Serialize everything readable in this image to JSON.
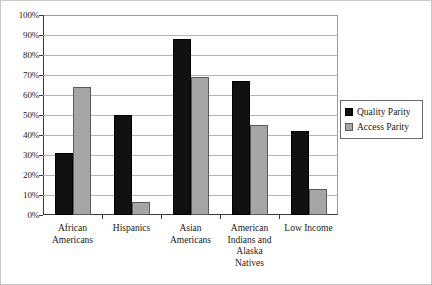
{
  "chart_data": {
    "type": "bar",
    "title": "",
    "xlabel": "",
    "ylabel": "",
    "ylim": [
      0,
      100
    ],
    "ytick_labels": [
      "100%",
      "90%",
      "80%",
      "70%",
      "60%",
      "50%",
      "40%",
      "30%",
      "20%",
      "10%",
      "0%"
    ],
    "ytick_values": [
      100,
      90,
      80,
      70,
      60,
      50,
      40,
      30,
      20,
      10,
      0
    ],
    "grid": true,
    "legend_position": "right",
    "categories": [
      "African Americans",
      "Hispanics",
      "Asian Americans",
      "American Indians and Alaska Natives",
      "Low Income"
    ],
    "category_lines": [
      [
        "African",
        "Americans"
      ],
      [
        "Hispanics"
      ],
      [
        "Asian",
        "Americans"
      ],
      [
        "American",
        "Indians and",
        "Alaska",
        "Natives"
      ],
      [
        "Low Income"
      ]
    ],
    "series": [
      {
        "name": "Quality Parity",
        "color": "#111111",
        "values": [
          31,
          50,
          88,
          67,
          42
        ]
      },
      {
        "name": "Access Parity",
        "color": "#a6a6a6",
        "values": [
          64,
          6.5,
          69,
          45,
          13
        ]
      }
    ]
  },
  "legend": {
    "items": [
      {
        "label": "Quality Parity",
        "icon": "square-swatch-black"
      },
      {
        "label": "Access Parity",
        "icon": "square-swatch-gray"
      }
    ]
  }
}
